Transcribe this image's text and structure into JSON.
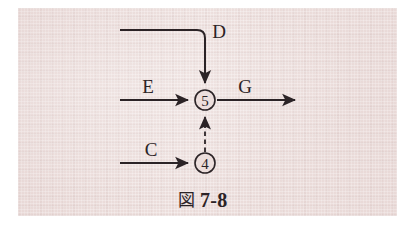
{
  "figure": {
    "caption_cjk": "図",
    "caption_number": "7-8",
    "caption_full": "図 7-8",
    "background_color": "#ecdedc",
    "ink_color": "#2b2326",
    "page_background": "#ffffff"
  },
  "nodes": [
    {
      "id": "node-5",
      "label": "5",
      "cx": 205,
      "cy": 100,
      "r": 10
    },
    {
      "id": "node-4",
      "label": "4",
      "cx": 205,
      "cy": 163,
      "r": 10
    }
  ],
  "edges": [
    {
      "id": "edge-d",
      "label": "D",
      "style": "solid",
      "shape": "elbow-down",
      "from": "open-left",
      "to": "node-5",
      "label_x": 219,
      "label_y": 38
    },
    {
      "id": "edge-e",
      "label": "E",
      "style": "solid",
      "shape": "horizontal",
      "from": "open-left",
      "to": "node-5",
      "label_x": 148,
      "label_y": 93
    },
    {
      "id": "edge-g",
      "label": "G",
      "style": "solid",
      "shape": "horizontal",
      "from": "node-5",
      "to": "open-right",
      "label_x": 245,
      "label_y": 93
    },
    {
      "id": "edge-c",
      "label": "C",
      "style": "solid",
      "shape": "horizontal",
      "from": "open-left",
      "to": "node-4",
      "label_x": 151,
      "label_y": 156
    },
    {
      "id": "edge-4-to-5",
      "label": "",
      "style": "dashed",
      "shape": "vertical",
      "from": "node-4",
      "to": "node-5",
      "label_x": 0,
      "label_y": 0
    }
  ]
}
